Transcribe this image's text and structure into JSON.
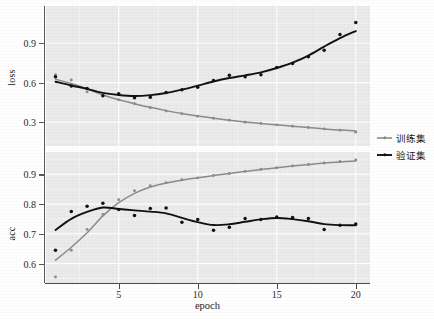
{
  "chart_data": {
    "type": "line",
    "title": "",
    "xlabel": "epoch",
    "grid": true,
    "legend_position": "right",
    "facets": [
      {
        "name": "loss",
        "ylabel": "loss",
        "yticks": [
          0.3,
          0.6,
          0.9
        ],
        "ytick_labels": [
          "0.3",
          "0.6",
          "0.9"
        ],
        "ylim": [
          0.12,
          1.18
        ],
        "series": [
          {
            "name": "训练集",
            "color": "#8c8c8c",
            "x": [
              1,
              2,
              3,
              4,
              5,
              6,
              7,
              8,
              9,
              10,
              11,
              12,
              13,
              14,
              15,
              16,
              17,
              18,
              19,
              20
            ],
            "values": [
              0.66,
              0.62,
              0.53,
              0.5,
              0.47,
              0.44,
              0.41,
              0.385,
              0.365,
              0.345,
              0.33,
              0.315,
              0.3,
              0.29,
              0.28,
              0.27,
              0.26,
              0.25,
              0.24,
              0.225
            ]
          },
          {
            "name": "验证集",
            "color": "#111111",
            "x": [
              1,
              2,
              3,
              4,
              5,
              6,
              7,
              8,
              9,
              10,
              11,
              12,
              13,
              14,
              15,
              16,
              17,
              18,
              19,
              20
            ],
            "values": [
              0.645,
              0.575,
              0.555,
              0.5,
              0.515,
              0.485,
              0.49,
              0.525,
              0.545,
              0.565,
              0.615,
              0.655,
              0.645,
              0.66,
              0.715,
              0.745,
              0.795,
              0.845,
              0.965,
              1.055
            ]
          }
        ]
      },
      {
        "name": "acc",
        "ylabel": "acc",
        "yticks": [
          0.6,
          0.7,
          0.8,
          0.9
        ],
        "ytick_labels": [
          "0.6",
          "0.7",
          "0.8",
          "0.9"
        ],
        "ylim": [
          0.535,
          0.975
        ],
        "series": [
          {
            "name": "训练集",
            "color": "#8c8c8c",
            "x": [
              1,
              2,
              3,
              4,
              5,
              6,
              7,
              8,
              9,
              10,
              11,
              12,
              13,
              14,
              15,
              16,
              17,
              18,
              19,
              20
            ],
            "values": [
              0.555,
              0.645,
              0.715,
              0.765,
              0.815,
              0.845,
              0.862,
              0.872,
              0.882,
              0.888,
              0.896,
              0.903,
              0.91,
              0.917,
              0.922,
              0.928,
              0.933,
              0.938,
              0.943,
              0.948
            ]
          },
          {
            "name": "验证集",
            "color": "#111111",
            "x": [
              1,
              2,
              3,
              4,
              5,
              6,
              7,
              8,
              9,
              10,
              11,
              12,
              13,
              14,
              15,
              16,
              17,
              18,
              19,
              20
            ],
            "values": [
              0.645,
              0.775,
              0.793,
              0.803,
              0.782,
              0.762,
              0.785,
              0.787,
              0.739,
              0.748,
              0.712,
              0.722,
              0.752,
              0.748,
              0.757,
              0.755,
              0.752,
              0.715,
              0.729,
              0.733
            ]
          }
        ]
      }
    ],
    "xticks": [
      5,
      10,
      15,
      20
    ],
    "xtick_labels": [
      "5",
      "10",
      "15",
      "20"
    ],
    "xlim": [
      0.4,
      20.9
    ]
  },
  "legend": {
    "items": [
      {
        "label": "训练集",
        "color": "#8c8c8c"
      },
      {
        "label": "验证集",
        "color": "#111111"
      }
    ]
  },
  "colors": {
    "panel_background": "#ebebeb",
    "gridline": "#ffffff",
    "train": "#8c8c8c",
    "validation": "#111111",
    "axis": "#4a4a4a",
    "text": "#1a1a1a"
  }
}
